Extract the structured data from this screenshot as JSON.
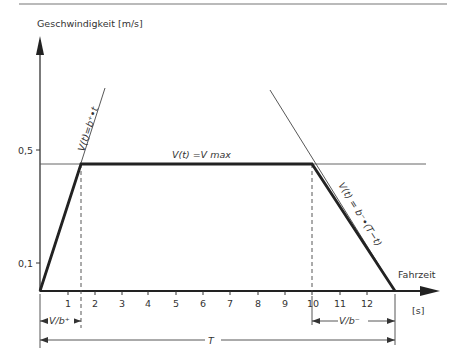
{
  "header_rule": true,
  "y_axis": {
    "label": "Geschwindigkeit [m/s]",
    "ticks": [
      {
        "value": 0.5,
        "label": "0,5"
      },
      {
        "value": 0.1,
        "label": "0,1"
      }
    ]
  },
  "x_axis": {
    "label": "Fahrzeit",
    "unit": "[s]",
    "ticks": [
      "1",
      "2",
      "3",
      "4",
      "5",
      "6",
      "7",
      "8",
      "9",
      "10",
      "11",
      "12"
    ]
  },
  "annotations": {
    "accel_line": "V(t)=b⁺•t",
    "plateau": "V(t) =V max",
    "decel_line": "V(t) = b⁻•(T−t)",
    "accel_time": "V/b⁺",
    "decel_time": "V/b⁻",
    "total_time": "T"
  },
  "profile": {
    "type": "trapezoid",
    "points": [
      [
        0,
        0
      ],
      [
        1.5,
        0.5
      ],
      [
        10,
        0.5
      ],
      [
        13.1,
        0
      ]
    ],
    "v_max": 0.5
  }
}
